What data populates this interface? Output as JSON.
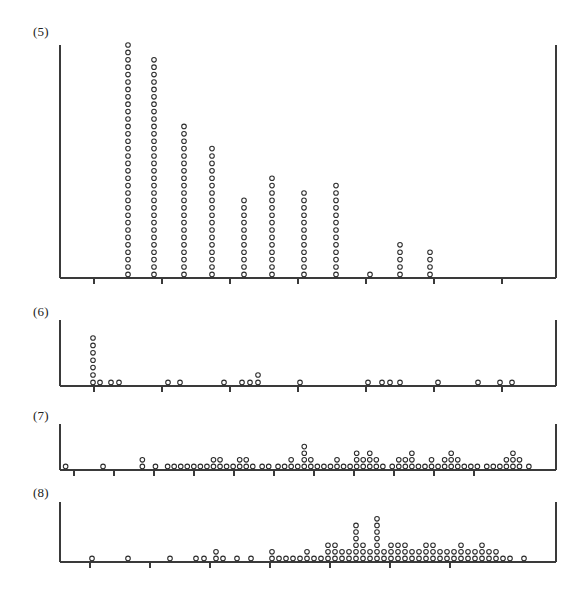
{
  "figure": {
    "width": 562,
    "height": 599,
    "background": "#ffffff",
    "ink_color": "#2b2b2b",
    "axis_color": "#3a3a3a",
    "marker": "open-circle",
    "marker_radius_px": 2.3
  },
  "panels": [
    {
      "id": "panel-5",
      "label": "(5)",
      "label_x": 33,
      "label_y": 32,
      "plot_left": 60,
      "plot_right": 556,
      "baseline_y": 278,
      "top_y": 45,
      "tick_positions_x": [
        94,
        162,
        230,
        298,
        366,
        434,
        502
      ],
      "tick_length": 6,
      "dot_dx": 7.4,
      "dot_dy": 7.4
    },
    {
      "id": "panel-6",
      "label": "(6)",
      "label_x": 33,
      "label_y": 312,
      "plot_left": 60,
      "plot_right": 556,
      "baseline_y": 386,
      "top_y": 320,
      "tick_positions_x": [
        94,
        162,
        230,
        298,
        366,
        434,
        502
      ],
      "tick_length": 6,
      "dot_dx": 7.4,
      "dot_dy": 7.4
    },
    {
      "id": "panel-7",
      "label": "(7)",
      "label_x": 33,
      "label_y": 415,
      "plot_left": 60,
      "plot_right": 556,
      "baseline_y": 470,
      "top_y": 424,
      "tick_positions_x": [
        74,
        114,
        154,
        194,
        234,
        274,
        314,
        354,
        394,
        434,
        474
      ],
      "tick_length": 6,
      "dot_dx": 6.6,
      "dot_dy": 6.6
    },
    {
      "id": "panel-8",
      "label": "(8)",
      "label_x": 33,
      "label_y": 492,
      "plot_left": 60,
      "plot_right": 556,
      "baseline_y": 562,
      "top_y": 502,
      "tick_positions_x": [
        90,
        150,
        210,
        270,
        330,
        390,
        450
      ],
      "tick_length": 6,
      "dot_dx": 6.6,
      "dot_dy": 6.6
    }
  ],
  "chart_data": [
    {
      "type": "scatter",
      "subtype": "dot-plot-stacked",
      "title": "(5)",
      "xlabel": "",
      "ylabel": "",
      "grid": false,
      "legend": null,
      "axis_range_px": [
        60,
        556
      ],
      "note": "Stacked dot plot; each circle is one observation. x is the pixel x of the stack, count is the number of stacked circles.",
      "stacks": [
        {
          "x": 128,
          "count": 32
        },
        {
          "x": 154,
          "count": 30
        },
        {
          "x": 184,
          "count": 21
        },
        {
          "x": 212,
          "count": 18
        },
        {
          "x": 244,
          "count": 11
        },
        {
          "x": 272,
          "count": 14
        },
        {
          "x": 304,
          "count": 12
        },
        {
          "x": 336,
          "count": 13
        },
        {
          "x": 370,
          "count": 1
        },
        {
          "x": 400,
          "count": 5
        },
        {
          "x": 430,
          "count": 4
        }
      ]
    },
    {
      "type": "scatter",
      "subtype": "dot-plot-stacked",
      "title": "(6)",
      "xlabel": "",
      "ylabel": "",
      "grid": false,
      "legend": null,
      "axis_range_px": [
        60,
        556
      ],
      "stacks": [
        {
          "x": 93,
          "count": 7
        },
        {
          "x": 100,
          "count": 1
        },
        {
          "x": 111,
          "count": 1
        },
        {
          "x": 119,
          "count": 1
        },
        {
          "x": 168,
          "count": 1
        },
        {
          "x": 180,
          "count": 1
        },
        {
          "x": 224,
          "count": 1
        },
        {
          "x": 242,
          "count": 1
        },
        {
          "x": 250,
          "count": 1
        },
        {
          "x": 258,
          "count": 2
        },
        {
          "x": 300,
          "count": 1
        },
        {
          "x": 368,
          "count": 1
        },
        {
          "x": 382,
          "count": 1
        },
        {
          "x": 390,
          "count": 1
        },
        {
          "x": 400,
          "count": 1
        },
        {
          "x": 438,
          "count": 1
        },
        {
          "x": 478,
          "count": 1
        },
        {
          "x": 500,
          "count": 1
        },
        {
          "x": 512,
          "count": 1
        }
      ]
    },
    {
      "type": "scatter",
      "subtype": "dot-plot-stacked",
      "title": "(7)",
      "xlabel": "",
      "ylabel": "",
      "grid": false,
      "legend": null,
      "axis_range_px": [
        60,
        556
      ],
      "stacks": [
        {
          "x": 86,
          "count": 1
        },
        {
          "x": 126,
          "count": 1
        },
        {
          "x": 168,
          "count": 2
        },
        {
          "x": 182,
          "count": 1
        },
        {
          "x": 195,
          "count": 1
        },
        {
          "x": 202,
          "count": 1
        },
        {
          "x": 209,
          "count": 1
        },
        {
          "x": 216,
          "count": 1
        },
        {
          "x": 223,
          "count": 1
        },
        {
          "x": 230,
          "count": 1
        },
        {
          "x": 237,
          "count": 1
        },
        {
          "x": 244,
          "count": 2
        },
        {
          "x": 251,
          "count": 2
        },
        {
          "x": 258,
          "count": 1
        },
        {
          "x": 265,
          "count": 1
        },
        {
          "x": 272,
          "count": 2
        },
        {
          "x": 279,
          "count": 2
        },
        {
          "x": 286,
          "count": 1
        },
        {
          "x": 296,
          "count": 1
        },
        {
          "x": 303,
          "count": 1
        },
        {
          "x": 313,
          "count": 1
        },
        {
          "x": 320,
          "count": 1
        },
        {
          "x": 327,
          "count": 2
        },
        {
          "x": 334,
          "count": 1
        },
        {
          "x": 341,
          "count": 4
        },
        {
          "x": 348,
          "count": 2
        },
        {
          "x": 355,
          "count": 1
        },
        {
          "x": 362,
          "count": 1
        },
        {
          "x": 369,
          "count": 1
        },
        {
          "x": 376,
          "count": 2
        },
        {
          "x": 383,
          "count": 1
        },
        {
          "x": 390,
          "count": 1
        },
        {
          "x": 397,
          "count": 3
        },
        {
          "x": 404,
          "count": 2
        },
        {
          "x": 411,
          "count": 3
        },
        {
          "x": 418,
          "count": 2
        },
        {
          "x": 425,
          "count": 1
        },
        {
          "x": 435,
          "count": 1
        },
        {
          "x": 442,
          "count": 2
        },
        {
          "x": 449,
          "count": 2
        },
        {
          "x": 456,
          "count": 3
        },
        {
          "x": 463,
          "count": 1
        },
        {
          "x": 470,
          "count": 1
        },
        {
          "x": 477,
          "count": 2
        },
        {
          "x": 484,
          "count": 1
        },
        {
          "x": 491,
          "count": 2
        },
        {
          "x": 498,
          "count": 3
        },
        {
          "x": 505,
          "count": 2
        },
        {
          "x": 512,
          "count": 1
        },
        {
          "x": 519,
          "count": 1
        },
        {
          "x": 526,
          "count": 1
        },
        {
          "x": 536,
          "count": 1
        },
        {
          "x": 543,
          "count": 1
        },
        {
          "x": 550,
          "count": 1
        },
        {
          "x": 557,
          "count": 2
        },
        {
          "x": 564,
          "count": 3
        },
        {
          "x": 571,
          "count": 2
        },
        {
          "x": 581,
          "count": 1
        }
      ]
    },
    {
      "type": "scatter",
      "subtype": "dot-plot-stacked",
      "title": "(8)",
      "xlabel": "",
      "ylabel": "",
      "grid": false,
      "legend": null,
      "axis_range_px": [
        60,
        556
      ],
      "stacks": [
        {
          "x": 92,
          "count": 1
        },
        {
          "x": 128,
          "count": 1
        },
        {
          "x": 170,
          "count": 1
        },
        {
          "x": 196,
          "count": 1
        },
        {
          "x": 204,
          "count": 1
        },
        {
          "x": 216,
          "count": 2
        },
        {
          "x": 223,
          "count": 1
        },
        {
          "x": 237,
          "count": 1
        },
        {
          "x": 251,
          "count": 1
        },
        {
          "x": 272,
          "count": 2
        },
        {
          "x": 279,
          "count": 1
        },
        {
          "x": 286,
          "count": 1
        },
        {
          "x": 293,
          "count": 1
        },
        {
          "x": 300,
          "count": 1
        },
        {
          "x": 307,
          "count": 2
        },
        {
          "x": 314,
          "count": 1
        },
        {
          "x": 321,
          "count": 1
        },
        {
          "x": 328,
          "count": 3
        },
        {
          "x": 335,
          "count": 3
        },
        {
          "x": 342,
          "count": 2
        },
        {
          "x": 349,
          "count": 2
        },
        {
          "x": 356,
          "count": 6
        },
        {
          "x": 363,
          "count": 3
        },
        {
          "x": 370,
          "count": 2
        },
        {
          "x": 377,
          "count": 7
        },
        {
          "x": 384,
          "count": 2
        },
        {
          "x": 391,
          "count": 3
        },
        {
          "x": 398,
          "count": 3
        },
        {
          "x": 405,
          "count": 3
        },
        {
          "x": 412,
          "count": 2
        },
        {
          "x": 419,
          "count": 2
        },
        {
          "x": 426,
          "count": 3
        },
        {
          "x": 433,
          "count": 3
        },
        {
          "x": 440,
          "count": 2
        },
        {
          "x": 447,
          "count": 2
        },
        {
          "x": 454,
          "count": 2
        },
        {
          "x": 461,
          "count": 3
        },
        {
          "x": 468,
          "count": 2
        },
        {
          "x": 475,
          "count": 2
        },
        {
          "x": 482,
          "count": 3
        },
        {
          "x": 489,
          "count": 2
        },
        {
          "x": 496,
          "count": 2
        },
        {
          "x": 503,
          "count": 1
        },
        {
          "x": 510,
          "count": 1
        },
        {
          "x": 524,
          "count": 1
        }
      ]
    }
  ]
}
